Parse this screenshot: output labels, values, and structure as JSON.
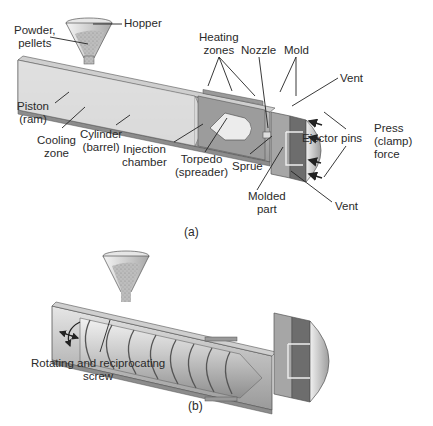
{
  "figure_a": {
    "caption": "(a)",
    "labels": {
      "hopper": "Hopper",
      "powder_pellets": [
        "Powder,",
        "pellets"
      ],
      "heating_zones": [
        "Heating",
        "zones"
      ],
      "nozzle": "Nozzle",
      "mold": "Mold",
      "vent_top": "Vent",
      "piston_ram": [
        "Piston",
        "(ram)"
      ],
      "cooling_zone": [
        "Cooling",
        "zone"
      ],
      "cylinder_barrel": [
        "Cylinder",
        "(barrel)"
      ],
      "injection_chamber": [
        "Injection",
        "chamber"
      ],
      "torpedo_spreader": [
        "Torpedo",
        "(spreader)"
      ],
      "sprue": "Sprue",
      "ejector_pins": "Ejector pins",
      "press_clamp_force": [
        "Press",
        "(clamp)",
        "force"
      ],
      "molded_part": [
        "Molded",
        "part"
      ],
      "vent_bottom": "Vent"
    }
  },
  "figure_b": {
    "caption": "(b)",
    "labels": {
      "screw": [
        "Rotating and reciprocating",
        "screw"
      ]
    }
  },
  "colors": {
    "barrel_light": "#d8d8d8",
    "barrel_mid": "#a9a9a9",
    "barrel_dark": "#7a7a7a",
    "mold_dark": "#6a6a6a",
    "text": "#2a2a2a"
  }
}
